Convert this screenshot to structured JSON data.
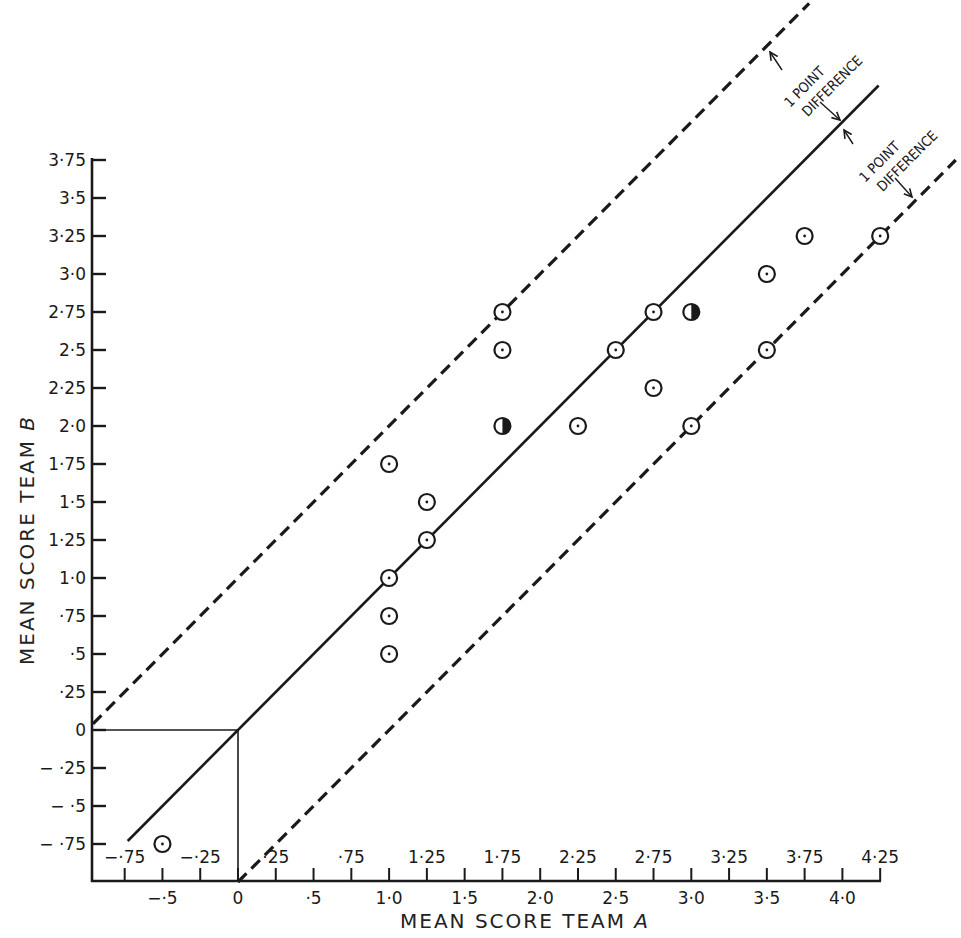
{
  "chart_data": {
    "type": "scatter",
    "title": "",
    "xlabel": "MEAN SCORE TEAM A",
    "ylabel": "MEAN SCORE TEAM B",
    "xlim": [
      -0.96,
      4.25
    ],
    "ylim": [
      -0.97,
      3.75
    ],
    "grid": false,
    "x_ticks_major": [
      {
        "value": -0.5,
        "label": "−·5"
      },
      {
        "value": 0,
        "label": "0"
      },
      {
        "value": 0.5,
        "label": "·5"
      },
      {
        "value": 1.0,
        "label": "1·0"
      },
      {
        "value": 1.5,
        "label": "1·5"
      },
      {
        "value": 2.0,
        "label": "2·0"
      },
      {
        "value": 2.5,
        "label": "2·5"
      },
      {
        "value": 3.0,
        "label": "3·0"
      },
      {
        "value": 3.5,
        "label": "3·5"
      },
      {
        "value": 4.0,
        "label": "4·0"
      }
    ],
    "x_ticks_minor": [
      {
        "value": -0.75,
        "label": "−·75"
      },
      {
        "value": -0.25,
        "label": "−·25"
      },
      {
        "value": 0.25,
        "label": "·25"
      },
      {
        "value": 0.75,
        "label": "·75"
      },
      {
        "value": 1.25,
        "label": "1·25"
      },
      {
        "value": 1.75,
        "label": "1·75"
      },
      {
        "value": 2.25,
        "label": "2·25"
      },
      {
        "value": 2.75,
        "label": "2·75"
      },
      {
        "value": 3.25,
        "label": "3·25"
      },
      {
        "value": 3.75,
        "label": "3·75"
      },
      {
        "value": 4.25,
        "label": "4·25"
      }
    ],
    "y_ticks": [
      {
        "value": 3.75,
        "label": "3·75"
      },
      {
        "value": 3.5,
        "label": "3·5"
      },
      {
        "value": 3.25,
        "label": "3·25"
      },
      {
        "value": 3.0,
        "label": "3·0"
      },
      {
        "value": 2.75,
        "label": "2·75"
      },
      {
        "value": 2.5,
        "label": "2·5"
      },
      {
        "value": 2.25,
        "label": "2·25"
      },
      {
        "value": 2.0,
        "label": "2·0"
      },
      {
        "value": 1.75,
        "label": "1·75"
      },
      {
        "value": 1.5,
        "label": "1·5"
      },
      {
        "value": 1.25,
        "label": "1·25"
      },
      {
        "value": 1.0,
        "label": "1·0"
      },
      {
        "value": 0.75,
        "label": "·75"
      },
      {
        "value": 0.5,
        "label": "·5"
      },
      {
        "value": 0.25,
        "label": "·25"
      },
      {
        "value": 0,
        "label": "0"
      },
      {
        "value": -0.25,
        "label": "− ·25"
      },
      {
        "value": -0.5,
        "label": "− ·5"
      },
      {
        "value": -0.75,
        "label": "− ·75"
      }
    ],
    "series": [
      {
        "name": "matches",
        "marker": "circle-dot",
        "points": [
          {
            "x": -0.5,
            "y": -0.75
          },
          {
            "x": 1.0,
            "y": 0.5
          },
          {
            "x": 1.0,
            "y": 0.75
          },
          {
            "x": 1.0,
            "y": 1.0
          },
          {
            "x": 1.0,
            "y": 1.75
          },
          {
            "x": 1.25,
            "y": 1.25
          },
          {
            "x": 1.25,
            "y": 1.5
          },
          {
            "x": 1.75,
            "y": 2.5
          },
          {
            "x": 1.75,
            "y": 2.75
          },
          {
            "x": 2.25,
            "y": 2.0
          },
          {
            "x": 2.5,
            "y": 2.5
          },
          {
            "x": 2.75,
            "y": 2.25
          },
          {
            "x": 2.75,
            "y": 2.75
          },
          {
            "x": 3.0,
            "y": 2.0
          },
          {
            "x": 3.5,
            "y": 2.5
          },
          {
            "x": 3.5,
            "y": 3.0
          },
          {
            "x": 3.75,
            "y": 3.25
          },
          {
            "x": 4.25,
            "y": 3.25
          }
        ]
      },
      {
        "name": "half-filled",
        "marker": "half-filled-circle",
        "points": [
          {
            "x": 1.75,
            "y": 2.0
          },
          {
            "x": 3.0,
            "y": 2.75
          }
        ]
      }
    ],
    "reference_lines": [
      {
        "name": "equality",
        "equation": "y = x",
        "style": "solid",
        "from_x": -0.73,
        "to_x": 4.24
      },
      {
        "name": "upper-1-point",
        "equation": "y = x + 1",
        "style": "dashed",
        "from_x": -0.96,
        "to_x": 3.78
      },
      {
        "name": "lower-1-point",
        "equation": "y = x - 1",
        "style": "dashed",
        "from_x": 0.0,
        "to_x": 4.75
      }
    ],
    "annotations": [
      {
        "text_line1": "1 POINT",
        "text_line2": "DIFFERENCE",
        "between": "upper dashed and solid line"
      },
      {
        "text_line1": "1 POINT",
        "text_line2": "DIFFERENCE",
        "between": "solid line and lower dashed"
      }
    ]
  },
  "labels": {
    "xlabel": "MEAN SCORE TEAM ",
    "xlabel_var": "A",
    "ylabel": "MEAN SCORE TEAM ",
    "ylabel_var": "B",
    "annot1_line1": "1 POINT",
    "annot1_line2": "DIFFERENCE",
    "annot2_line1": "1 POINT",
    "annot2_line2": "DIFFERENCE"
  }
}
